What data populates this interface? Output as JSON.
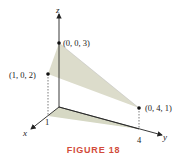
{
  "figure": {
    "caption": "FIGURE 18",
    "axes": {
      "x_label": "x",
      "y_label": "y",
      "z_label": "z",
      "x_tick": "1",
      "y_tick": "4"
    },
    "points": [
      {
        "label": "(0, 0, 3)",
        "coords": [
          0,
          0,
          3
        ]
      },
      {
        "label": "(1, 0, 2)",
        "coords": [
          1,
          0,
          2
        ]
      },
      {
        "label": "(0, 4, 1)",
        "coords": [
          0,
          4,
          1
        ]
      }
    ],
    "colors": {
      "plane_fill": "#dcdccb",
      "shadow_fill": "#d6d8c4",
      "axis": "#222222",
      "caption": "#d24b3a"
    }
  }
}
